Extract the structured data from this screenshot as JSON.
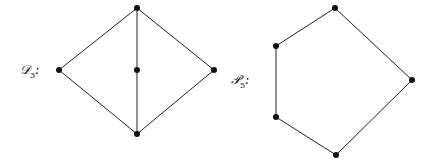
{
  "graphs": [
    {
      "name": "D3",
      "label_main": "𝒟",
      "label_sub": "3",
      "label_suffix": ":",
      "label_pos": [
        20,
        62
      ],
      "vertices": [
        [
          137,
          8
        ],
        [
          59,
          70
        ],
        [
          137,
          70
        ],
        [
          214,
          70
        ],
        [
          137,
          134
        ]
      ],
      "edges": [
        [
          0,
          1
        ],
        [
          0,
          3
        ],
        [
          1,
          4
        ],
        [
          3,
          4
        ],
        [
          0,
          2
        ],
        [
          2,
          4
        ]
      ]
    },
    {
      "name": "P5",
      "label_main": "𝒫",
      "label_sub": "5",
      "label_suffix": ":",
      "label_pos": [
        231,
        72
      ],
      "vertices": [
        [
          335,
          8
        ],
        [
          276,
          46
        ],
        [
          412,
          80
        ],
        [
          276,
          117
        ],
        [
          336,
          155
        ]
      ],
      "edges": [
        [
          0,
          1
        ],
        [
          0,
          2
        ],
        [
          1,
          3
        ],
        [
          3,
          4
        ],
        [
          4,
          2
        ]
      ]
    }
  ],
  "style": {
    "stroke": "#222222",
    "vertex_fill": "#111111",
    "vertex_radius": 3
  }
}
